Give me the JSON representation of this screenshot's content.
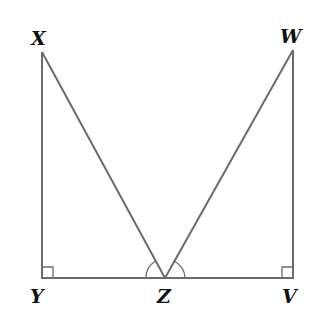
{
  "diagram": {
    "type": "geometry",
    "points": {
      "X": {
        "label": "X",
        "x": 42,
        "y": 52
      },
      "Y": {
        "label": "Y",
        "x": 42,
        "y": 278
      },
      "Z": {
        "label": "Z",
        "x": 165,
        "y": 278
      },
      "V": {
        "label": "V",
        "x": 293,
        "y": 278
      },
      "W": {
        "label": "W",
        "x": 293,
        "y": 50
      }
    },
    "segments": [
      "XY",
      "YV",
      "XZ",
      "WZ",
      "WV"
    ],
    "right_angles": [
      "Y",
      "V"
    ],
    "marked_angles": [
      "XZY",
      "WZV"
    ]
  }
}
